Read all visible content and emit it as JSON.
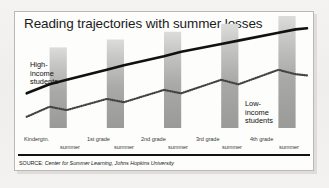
{
  "figure": {
    "title": "Reading trajectories with summer losses",
    "source_prefix": "SOURCE:",
    "source_text": "Center for Summer Learning, Johns Hopkins University",
    "high_label": "High-\nincome\nstudents",
    "high_label_lines": [
      "High-",
      "income",
      "students"
    ],
    "low_label_lines": [
      "Low-",
      "income",
      "students"
    ]
  },
  "chart_data": {
    "type": "line",
    "title": "Reading trajectories with summer losses",
    "subtitle": "",
    "xlabel": "",
    "ylabel": "Reading achievement",
    "grid": false,
    "legend": "inline annotations",
    "xlim": [
      0,
      10
    ],
    "ylim": [
      0,
      10
    ],
    "categories": [
      "Kindergtn.",
      "summer",
      "1st grade",
      "summer",
      "2nd grade",
      "summer",
      "3rd grade",
      "summer",
      "4th grade",
      "summer"
    ],
    "summer_bands": [
      {
        "label": "summer",
        "x_start": 1.0,
        "x_end": 1.6,
        "height": 7.2
      },
      {
        "label": "summer",
        "x_start": 3.0,
        "x_end": 3.6,
        "height": 7.9
      },
      {
        "label": "summer",
        "x_start": 5.0,
        "x_end": 5.6,
        "height": 8.6
      },
      {
        "label": "summer",
        "x_start": 7.0,
        "x_end": 7.6,
        "height": 9.3
      },
      {
        "label": "summer",
        "x_start": 9.0,
        "x_end": 9.6,
        "height": 10.0
      }
    ],
    "series": [
      {
        "name": "High-income students",
        "style": "solid",
        "color": "#111111",
        "x": [
          0.2,
          1.0,
          1.6,
          3.0,
          3.6,
          5.0,
          5.6,
          7.0,
          7.6,
          9.0,
          9.6,
          10.0
        ],
        "y": [
          3.1,
          3.9,
          4.3,
          5.2,
          5.6,
          6.4,
          6.8,
          7.5,
          7.8,
          8.5,
          8.8,
          8.9
        ]
      },
      {
        "name": "Low-income students",
        "style": "dotted",
        "color": "#444444",
        "x": [
          0.2,
          1.0,
          1.6,
          3.0,
          3.6,
          5.0,
          5.6,
          7.0,
          7.6,
          9.0,
          9.6,
          10.0
        ],
        "y": [
          1.0,
          1.9,
          1.6,
          2.6,
          2.3,
          3.4,
          3.1,
          4.3,
          3.9,
          5.2,
          4.8,
          4.7
        ]
      }
    ],
    "annotations": [
      {
        "text": "High-income students",
        "x": 0.6,
        "y": 5.2
      },
      {
        "text": "Low-income students",
        "x": 8.2,
        "y": 2.6
      }
    ]
  },
  "axis": {
    "ticks": [
      {
        "label": "Kindergtn.",
        "kind": "grade",
        "left": 24
      },
      {
        "label": "summer",
        "kind": "summer",
        "left": 60
      },
      {
        "label": "1st grade",
        "kind": "grade",
        "left": 87
      },
      {
        "label": "summer",
        "kind": "summer",
        "left": 114
      },
      {
        "label": "2nd grade",
        "kind": "grade",
        "left": 141
      },
      {
        "label": "summer",
        "kind": "summer",
        "left": 168
      },
      {
        "label": "3rd grade",
        "kind": "grade",
        "left": 196
      },
      {
        "label": "summer",
        "kind": "summer",
        "left": 222
      },
      {
        "label": "4th grade",
        "kind": "grade",
        "left": 250
      },
      {
        "label": "summer",
        "kind": "summer",
        "left": 279
      }
    ]
  },
  "colors": {
    "page_background": "#f2f1ef",
    "panel_background": "#fdfdfc",
    "panel_border": "#b9b8b4",
    "bar_top": "#d8d8d6",
    "bar_bottom": "#9d9d9b",
    "solid_line": "#111111",
    "dotted_line": "#4a4a4a",
    "rule": "#121212",
    "text": "#1b1b1b"
  }
}
